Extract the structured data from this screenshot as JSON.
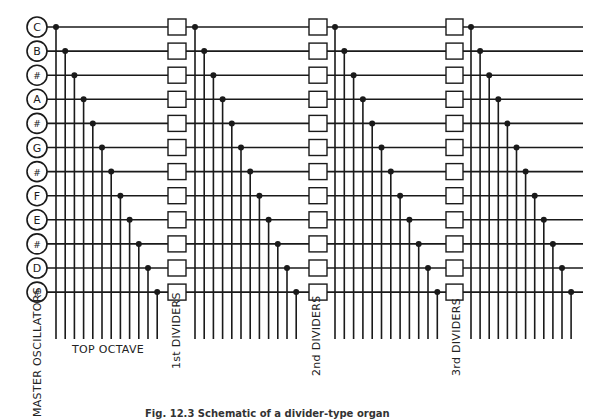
{
  "diagram": {
    "notes": [
      "C",
      "B",
      "#",
      "A",
      "#",
      "G",
      "#",
      "F",
      "E",
      "#",
      "D",
      "#"
    ],
    "row_y_start": 27,
    "row_spacing": 24.1,
    "oscillator_x": 37,
    "oscillator_r": 10,
    "stages": [
      {
        "name": "top-octave",
        "dot_x_start": 56,
        "dot_spacing": 9.2
      },
      {
        "name": "1st-dividers",
        "box_x": 168,
        "box_w": 18,
        "dot_x_start": 195,
        "dot_spacing": 9.2
      },
      {
        "name": "2nd-dividers",
        "box_x": 309,
        "box_w": 18,
        "dot_x_start": 335,
        "dot_spacing": 9.3
      },
      {
        "name": "3rd-dividers",
        "box_x": 446,
        "box_w": 17,
        "dot_x_start": 471,
        "dot_spacing": 9.1
      }
    ],
    "line_end_x": 583,
    "vertical_bottom_y": 339,
    "stroke_color": "#1a1a1a"
  },
  "labels": {
    "master_oscillators": "MASTER OSCILLATORS",
    "top_octave": "TOP OCTAVE",
    "first_dividers": "1st DIVIDERS",
    "second_dividers": "2nd DIVIDERS",
    "third_dividers": "3rd DIVIDERS"
  },
  "caption": "Fig. 12.3 Schematic of a divider-type organ"
}
